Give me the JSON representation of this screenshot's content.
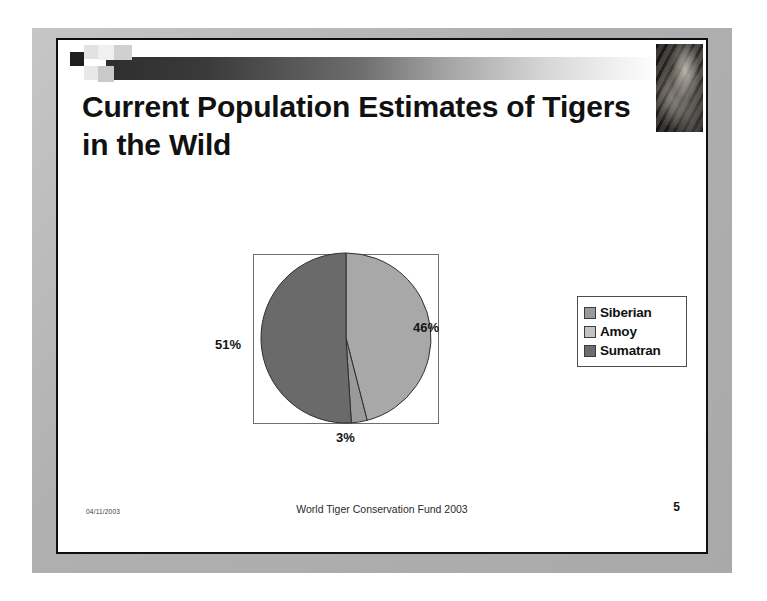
{
  "slide": {
    "title": "Current Population Estimates of Tigers in the Wild",
    "header_image_name": "tiger-photo"
  },
  "footer": {
    "date": "04/11/2003",
    "center_text": "World Tiger Conservation Fund 2003",
    "page_number": "5"
  },
  "legend": {
    "items": [
      {
        "label": "Siberian",
        "color": "#9a9a9a"
      },
      {
        "label": "Amoy",
        "color": "#c2c2c2"
      },
      {
        "label": "Sumatran",
        "color": "#6d6d6d"
      }
    ]
  },
  "labels": {
    "pct_51": "51%",
    "pct_46": "46%",
    "pct_3": "3%"
  },
  "chart_data": {
    "type": "pie",
    "title": "Current Population Estimates of Tigers in the Wild",
    "categories": [
      "Siberian",
      "Amoy",
      "Sumatran"
    ],
    "values": [
      46,
      3,
      51
    ],
    "value_labels": [
      "46%",
      "3%",
      "51%"
    ],
    "units": "percent",
    "colors": [
      "#a8a8a8",
      "#9a9a9a",
      "#6a6a6a"
    ],
    "legend_position": "right",
    "grid": false,
    "plot_border": true,
    "start_angle_deg": 0,
    "direction": "clockwise"
  }
}
